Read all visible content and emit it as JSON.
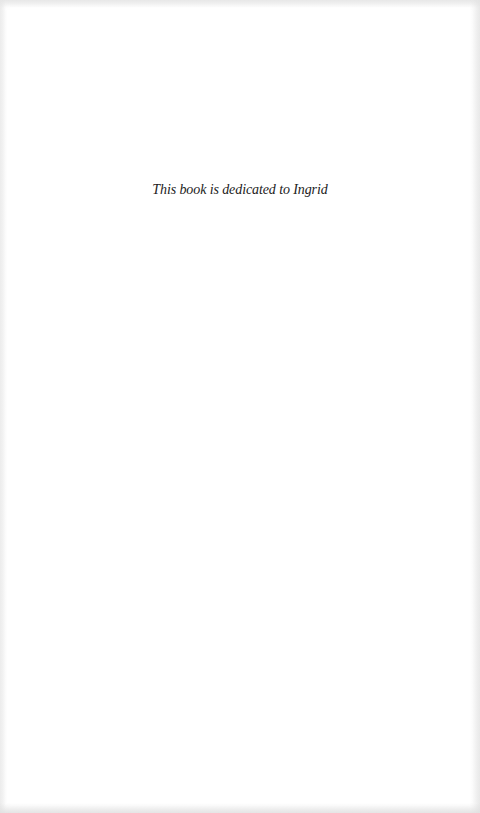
{
  "page": {
    "background_color": "#ffffff",
    "text_color": "#222222"
  },
  "dedication": {
    "text": "This book is dedicated to Ingrid"
  }
}
